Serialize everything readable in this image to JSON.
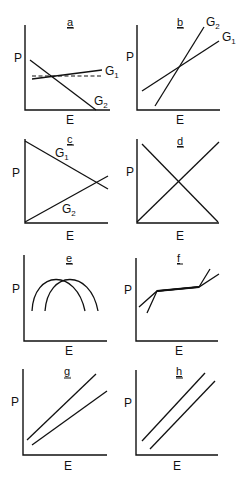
{
  "figure": {
    "y_axis_label": "P",
    "x_axis_label": "E",
    "panels": [
      {
        "id": "a",
        "letter": "a",
        "curve_labels": [
          "G1",
          "G2"
        ],
        "description": "G2 declines steeply; G1 rises slightly; dashed horizontal reference line"
      },
      {
        "id": "b",
        "letter": "b",
        "curve_labels": [
          "G2",
          "G1"
        ],
        "description": "Two rising lines crossing; G2 steeper"
      },
      {
        "id": "c",
        "letter": "c",
        "curve_labels": [
          "G1",
          "G2"
        ],
        "description": "G1 declines, G2 rises; crossing near right edge"
      },
      {
        "id": "d",
        "letter": "d",
        "curve_labels": [],
        "description": "Two lines crossing in center (X shape)"
      },
      {
        "id": "e",
        "letter": "e",
        "curve_labels": [],
        "description": "Two overlapping inverted-U curves shifted horizontally"
      },
      {
        "id": "f",
        "letter": "f",
        "curve_labels": [],
        "description": "Two lines converging to a shared plateau segment then diverging"
      },
      {
        "id": "g",
        "letter": "g",
        "curve_labels": [],
        "description": "Two rising lines diverging with different slopes"
      },
      {
        "id": "h",
        "letter": "h",
        "curve_labels": [],
        "description": "Two parallel rising lines"
      }
    ]
  },
  "labels": {
    "P": "P",
    "E": "E",
    "G": "G",
    "sub1": "1",
    "sub2": "2",
    "a": "a",
    "b": "b",
    "c": "c",
    "d": "d",
    "e": "e",
    "f": "f",
    "g": "g",
    "h": "h"
  }
}
